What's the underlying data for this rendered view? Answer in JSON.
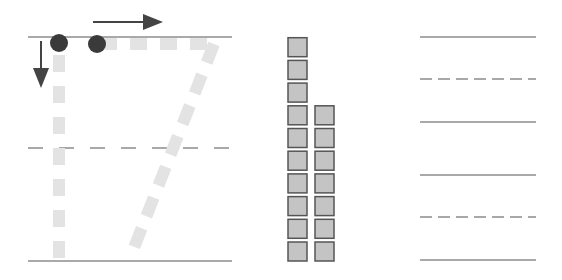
{
  "colors": {
    "line": "#8c8c8c",
    "trace": "#e3e3e3",
    "dot": "#3a3a3a",
    "arrow": "#444444",
    "square_fill": "#c4c4c4",
    "square_stroke": "#555555",
    "background": "#ffffff"
  },
  "tracing_panel": {
    "digit": "7",
    "start_dots": 2,
    "arrows": [
      "right-arrow",
      "down-arrow"
    ],
    "guide_lines": [
      "solid",
      "dashed",
      "solid"
    ]
  },
  "counting_blocks": {
    "columns": [
      10,
      7
    ],
    "total": 17
  },
  "practice_lines": {
    "rows": 2,
    "pattern": [
      "solid",
      "dashed",
      "solid"
    ]
  }
}
